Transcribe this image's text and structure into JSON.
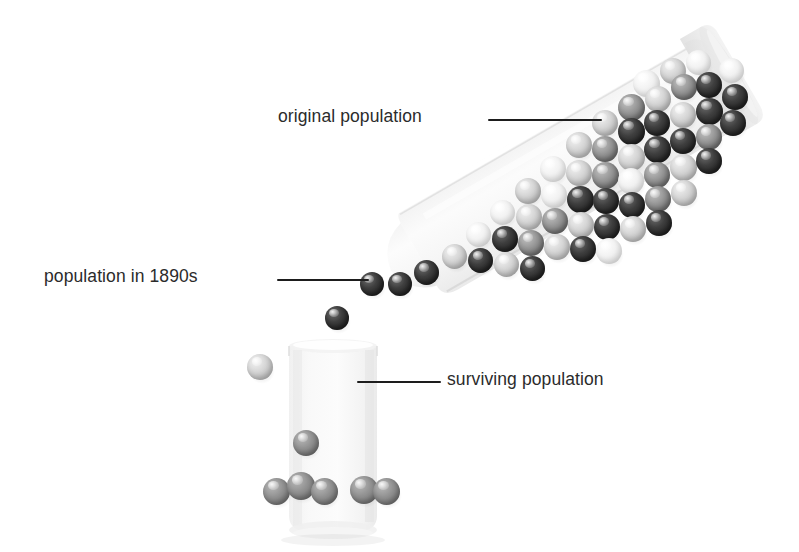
{
  "figure": {
    "background_color": "#ffffff",
    "text_color": "#2b2b2b",
    "leader_line_color": "#1d1d1d"
  },
  "labels": {
    "original": "original population",
    "in_1890s": "population in 1890s",
    "surviving": "surviving population"
  },
  "bead_palette": {
    "dark": "#2f2f2f",
    "mid": "#8a8a8a",
    "light": "#c8c8c8",
    "white": "#ededed",
    "gray": "#858585"
  },
  "glassware": {
    "tube": {
      "name": "tilted test tube",
      "tilt_degrees": -30,
      "fill_color": "#f4f4f4"
    },
    "beaker": {
      "name": "upright beaker",
      "fill_color": "#f2f2f2"
    }
  },
  "bead_counts": {
    "in_tube": 52,
    "pouring": 4,
    "in_beaker": 7
  },
  "beads_tube": [
    {
      "x": 303,
      "y": 60,
      "d": 27,
      "tone": "b-white"
    },
    {
      "x": 330,
      "y": 48,
      "d": 26,
      "tone": "b-light"
    },
    {
      "x": 356,
      "y": 40,
      "d": 25,
      "tone": "b-white"
    },
    {
      "x": 288,
      "y": 84,
      "d": 27,
      "tone": "b-mid"
    },
    {
      "x": 315,
      "y": 76,
      "d": 26,
      "tone": "b-light"
    },
    {
      "x": 341,
      "y": 64,
      "d": 26,
      "tone": "b-mid"
    },
    {
      "x": 366,
      "y": 62,
      "d": 26,
      "tone": "b-dark"
    },
    {
      "x": 389,
      "y": 48,
      "d": 25,
      "tone": "b-white"
    },
    {
      "x": 262,
      "y": 100,
      "d": 26,
      "tone": "b-light"
    },
    {
      "x": 288,
      "y": 108,
      "d": 27,
      "tone": "b-dark"
    },
    {
      "x": 314,
      "y": 100,
      "d": 26,
      "tone": "b-dark"
    },
    {
      "x": 340,
      "y": 92,
      "d": 26,
      "tone": "b-light"
    },
    {
      "x": 366,
      "y": 88,
      "d": 27,
      "tone": "b-dark"
    },
    {
      "x": 392,
      "y": 74,
      "d": 26,
      "tone": "b-dark"
    },
    {
      "x": 236,
      "y": 122,
      "d": 26,
      "tone": "b-light"
    },
    {
      "x": 262,
      "y": 126,
      "d": 26,
      "tone": "b-mid"
    },
    {
      "x": 288,
      "y": 134,
      "d": 27,
      "tone": "b-light"
    },
    {
      "x": 314,
      "y": 126,
      "d": 27,
      "tone": "b-dark"
    },
    {
      "x": 340,
      "y": 118,
      "d": 26,
      "tone": "b-dark"
    },
    {
      "x": 366,
      "y": 114,
      "d": 26,
      "tone": "b-mid"
    },
    {
      "x": 390,
      "y": 100,
      "d": 26,
      "tone": "b-dark"
    },
    {
      "x": 210,
      "y": 146,
      "d": 26,
      "tone": "b-white"
    },
    {
      "x": 236,
      "y": 150,
      "d": 26,
      "tone": "b-light"
    },
    {
      "x": 262,
      "y": 152,
      "d": 27,
      "tone": "b-mid"
    },
    {
      "x": 288,
      "y": 158,
      "d": 26,
      "tone": "b-white"
    },
    {
      "x": 314,
      "y": 152,
      "d": 26,
      "tone": "b-mid"
    },
    {
      "x": 340,
      "y": 144,
      "d": 27,
      "tone": "b-light"
    },
    {
      "x": 366,
      "y": 138,
      "d": 26,
      "tone": "b-dark"
    },
    {
      "x": 185,
      "y": 168,
      "d": 26,
      "tone": "b-light"
    },
    {
      "x": 211,
      "y": 172,
      "d": 26,
      "tone": "b-white"
    },
    {
      "x": 237,
      "y": 176,
      "d": 27,
      "tone": "b-dark"
    },
    {
      "x": 263,
      "y": 178,
      "d": 26,
      "tone": "b-dark"
    },
    {
      "x": 289,
      "y": 182,
      "d": 26,
      "tone": "b-dark"
    },
    {
      "x": 315,
      "y": 176,
      "d": 26,
      "tone": "b-mid"
    },
    {
      "x": 341,
      "y": 170,
      "d": 26,
      "tone": "b-light"
    },
    {
      "x": 160,
      "y": 190,
      "d": 25,
      "tone": "b-white"
    },
    {
      "x": 186,
      "y": 194,
      "d": 26,
      "tone": "b-light"
    },
    {
      "x": 212,
      "y": 198,
      "d": 26,
      "tone": "b-mid"
    },
    {
      "x": 238,
      "y": 202,
      "d": 26,
      "tone": "b-light"
    },
    {
      "x": 264,
      "y": 204,
      "d": 26,
      "tone": "b-dark"
    },
    {
      "x": 290,
      "y": 206,
      "d": 26,
      "tone": "b-light"
    },
    {
      "x": 316,
      "y": 200,
      "d": 26,
      "tone": "b-dark"
    },
    {
      "x": 136,
      "y": 212,
      "d": 25,
      "tone": "b-white"
    },
    {
      "x": 162,
      "y": 216,
      "d": 26,
      "tone": "b-dark"
    },
    {
      "x": 188,
      "y": 220,
      "d": 26,
      "tone": "b-mid"
    },
    {
      "x": 214,
      "y": 224,
      "d": 26,
      "tone": "b-light"
    },
    {
      "x": 240,
      "y": 226,
      "d": 26,
      "tone": "b-dark"
    },
    {
      "x": 266,
      "y": 228,
      "d": 26,
      "tone": "b-white"
    },
    {
      "x": 112,
      "y": 234,
      "d": 25,
      "tone": "b-light"
    },
    {
      "x": 138,
      "y": 238,
      "d": 25,
      "tone": "b-dark"
    },
    {
      "x": 164,
      "y": 242,
      "d": 25,
      "tone": "b-light"
    },
    {
      "x": 190,
      "y": 246,
      "d": 25,
      "tone": "b-dark"
    }
  ],
  "beads_pouring": [
    {
      "x": 84,
      "y": 250,
      "d": 25,
      "tone": "b-dark"
    },
    {
      "x": 58,
      "y": 262,
      "d": 24,
      "tone": "b-dark"
    },
    {
      "x": 30,
      "y": 262,
      "d": 24,
      "tone": "b-dark"
    },
    {
      "x": -5,
      "y": 296,
      "d": 24,
      "tone": "b-dark"
    }
  ],
  "beads_beaker": [
    {
      "x": -8,
      "y": 24,
      "d": 26,
      "tone": "b-light"
    },
    {
      "x": 38,
      "y": 100,
      "d": 26,
      "tone": "b-gray"
    },
    {
      "x": 8,
      "y": 148,
      "d": 27,
      "tone": "b-gray"
    },
    {
      "x": 32,
      "y": 142,
      "d": 28,
      "tone": "b-gray"
    },
    {
      "x": 56,
      "y": 148,
      "d": 27,
      "tone": "b-gray"
    },
    {
      "x": 95,
      "y": 146,
      "d": 28,
      "tone": "b-gray"
    },
    {
      "x": 118,
      "y": 148,
      "d": 27,
      "tone": "b-gray"
    }
  ]
}
